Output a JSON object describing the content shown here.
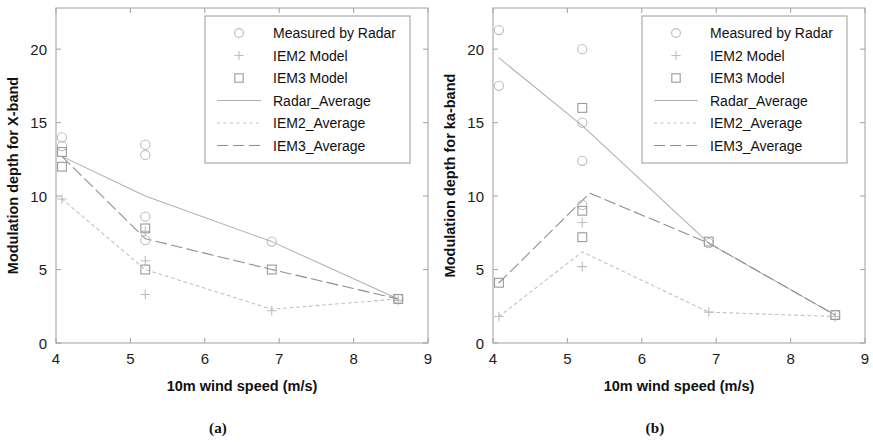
{
  "figure": {
    "panels": [
      {
        "id": "a",
        "caption": "(a)"
      },
      {
        "id": "b",
        "caption": "(b)"
      }
    ]
  },
  "legend": {
    "entries": [
      {
        "label": "Measured by Radar",
        "symbol": "circle"
      },
      {
        "label": "IEM2 Model",
        "symbol": "plus"
      },
      {
        "label": "IEM3 Model",
        "symbol": "square"
      },
      {
        "label": "Radar_Average",
        "symbol": "line-solid"
      },
      {
        "label": "IEM2_Average",
        "symbol": "line-dotted"
      },
      {
        "label": "IEM3_Average",
        "symbol": "line-dashed"
      }
    ]
  },
  "colors": {
    "axis": "#a8a8a8",
    "text": "#1c1c1c",
    "marker_light": "#bdbdbd",
    "marker_mid": "#9a9a9a",
    "line_radar": "#b0b0b0",
    "line_iem2": "#bfbfbf",
    "line_iem3": "#8f8f8f",
    "legend_border": "#9a9a9a",
    "background": "#ffffff"
  },
  "chart_data": [
    {
      "type": "scatter",
      "panel": "a",
      "title": "",
      "xlabel": "10m wind speed (m/s)",
      "ylabel": "Modulation depth for X-band",
      "xlim": [
        4,
        9
      ],
      "ylim": [
        0,
        22.8
      ],
      "xticks": [
        4,
        5,
        6,
        7,
        8,
        9
      ],
      "yticks": [
        0,
        5,
        10,
        15,
        20
      ],
      "grid": false,
      "legend_position": "top-right",
      "series": [
        {
          "name": "Measured by Radar",
          "marker": "circle",
          "x": [
            4.08,
            4.08,
            5.2,
            5.2,
            5.2,
            5.2,
            6.9,
            8.6
          ],
          "y": [
            14.0,
            13.4,
            13.5,
            12.8,
            8.6,
            7.0,
            6.9,
            3.0
          ]
        },
        {
          "name": "IEM2 Model",
          "marker": "plus",
          "x": [
            4.08,
            5.2,
            5.2,
            5.2,
            6.9,
            8.6
          ],
          "y": [
            9.8,
            7.6,
            5.6,
            3.3,
            2.2,
            2.9
          ]
        },
        {
          "name": "IEM3 Model",
          "marker": "square",
          "x": [
            4.08,
            4.08,
            5.2,
            5.2,
            6.9,
            8.6
          ],
          "y": [
            13.0,
            12.0,
            7.8,
            5.0,
            5.0,
            3.0
          ]
        },
        {
          "name": "Radar_Average",
          "marker": "line-solid",
          "x": [
            4.08,
            5.2,
            6.9,
            8.6
          ],
          "y": [
            12.7,
            10.0,
            6.9,
            3.0
          ]
        },
        {
          "name": "IEM2_Average",
          "marker": "line-dotted",
          "x": [
            4.08,
            5.2,
            6.9,
            8.6
          ],
          "y": [
            9.8,
            5.0,
            2.3,
            3.0
          ]
        },
        {
          "name": "IEM3_Average",
          "marker": "line-dashed",
          "x": [
            4.08,
            5.2,
            6.9,
            8.6
          ],
          "y": [
            12.7,
            7.1,
            5.0,
            3.0
          ]
        }
      ]
    },
    {
      "type": "scatter",
      "panel": "b",
      "title": "",
      "xlabel": "10m wind speed (m/s)",
      "ylabel": "Modulation depth for ka-band",
      "xlim": [
        4,
        9
      ],
      "ylim": [
        0,
        22.8
      ],
      "xticks": [
        4,
        5,
        6,
        7,
        8,
        9
      ],
      "yticks": [
        0,
        5,
        10,
        15,
        20
      ],
      "grid": false,
      "legend_position": "top-right",
      "series": [
        {
          "name": "Measured by Radar",
          "marker": "circle",
          "x": [
            4.08,
            4.08,
            5.2,
            5.2,
            5.2,
            5.2,
            6.9,
            8.6
          ],
          "y": [
            21.3,
            17.5,
            20.0,
            15.0,
            12.4,
            9.4,
            6.8,
            1.9
          ]
        },
        {
          "name": "IEM2 Model",
          "marker": "plus",
          "x": [
            4.08,
            5.2,
            5.2,
            6.9,
            8.6
          ],
          "y": [
            1.8,
            8.2,
            5.2,
            2.1,
            1.8
          ]
        },
        {
          "name": "IEM3 Model",
          "marker": "square",
          "x": [
            4.08,
            5.2,
            5.2,
            5.2,
            6.9,
            8.6
          ],
          "y": [
            4.1,
            16.0,
            9.0,
            7.2,
            6.9,
            1.9
          ]
        },
        {
          "name": "Radar_Average",
          "marker": "line-solid",
          "x": [
            4.08,
            5.2,
            6.9,
            8.6
          ],
          "y": [
            19.4,
            14.8,
            6.8,
            1.9
          ]
        },
        {
          "name": "IEM2_Average",
          "marker": "line-dotted",
          "x": [
            4.08,
            5.2,
            6.9,
            8.6
          ],
          "y": [
            1.8,
            6.2,
            2.1,
            1.8
          ]
        },
        {
          "name": "IEM3_Average",
          "marker": "line-dashed",
          "x": [
            4.08,
            5.3,
            6.9,
            8.6
          ],
          "y": [
            4.1,
            10.2,
            6.8,
            1.9
          ]
        }
      ]
    }
  ]
}
